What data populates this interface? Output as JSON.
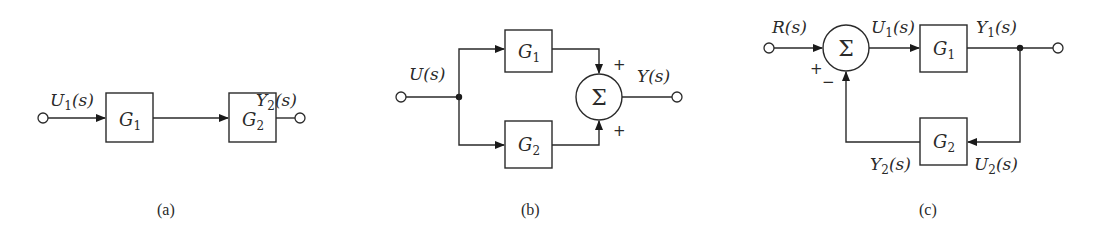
{
  "figure": {
    "panels": [
      {
        "id": "a",
        "caption": "(a)",
        "topology": "series",
        "input_label": {
          "var": "U",
          "sub": "1",
          "arg": "(s)"
        },
        "output_label": {
          "var": "Y",
          "sub": "2",
          "arg": "(s)"
        },
        "blocks": [
          {
            "var": "G",
            "sub": "1"
          },
          {
            "var": "G",
            "sub": "2"
          }
        ]
      },
      {
        "id": "b",
        "caption": "(b)",
        "topology": "parallel",
        "input_label": {
          "var": "U",
          "arg": "(s)"
        },
        "output_label": {
          "var": "Y",
          "arg": "(s)"
        },
        "blocks": [
          {
            "var": "G",
            "sub": "1"
          },
          {
            "var": "G",
            "sub": "2"
          }
        ],
        "summer": {
          "symbol": "Σ",
          "signs": [
            "+",
            "+"
          ]
        }
      },
      {
        "id": "c",
        "caption": "(c)",
        "topology": "feedback",
        "input_label": {
          "var": "R",
          "arg": "(s)"
        },
        "summer_output_label": {
          "var": "U",
          "sub": "1",
          "arg": "(s)"
        },
        "forward_output_label": {
          "var": "Y",
          "sub": "1",
          "arg": "(s)"
        },
        "feedback_input_label": {
          "var": "U",
          "sub": "2",
          "arg": "(s)"
        },
        "feedback_output_label": {
          "var": "Y",
          "sub": "2",
          "arg": "(s)"
        },
        "blocks": [
          {
            "var": "G",
            "sub": "1"
          },
          {
            "var": "G",
            "sub": "2"
          }
        ],
        "summer": {
          "symbol": "Σ",
          "signs": [
            "+",
            "−"
          ]
        }
      }
    ]
  }
}
